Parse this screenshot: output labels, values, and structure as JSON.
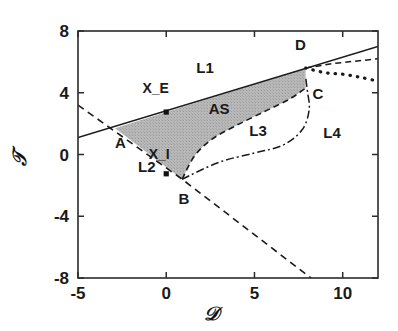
{
  "chart_data": {
    "type": "line",
    "title": "",
    "xlabel": "D",
    "ylabel": "T",
    "xlim": [
      -5,
      12
    ],
    "ylim": [
      -8,
      8
    ],
    "xticks": [
      -5,
      0,
      5,
      10
    ],
    "xticklabels": [
      "-5",
      "0",
      "5",
      "10"
    ],
    "yticks": [
      -8,
      -4,
      0,
      4,
      8
    ],
    "yticklabels": [
      "-8",
      "-4",
      "0",
      "4",
      "8"
    ],
    "grid": false,
    "legend": "none",
    "series": [
      {
        "name": "L1",
        "style": "solid",
        "points": [
          [
            -5,
            1.1
          ],
          [
            12,
            7.0
          ]
        ]
      },
      {
        "name": "L2",
        "style": "dashed",
        "points": [
          [
            -5,
            3.2
          ],
          [
            0.9,
            -1.6
          ],
          [
            8.2,
            -8.0
          ]
        ]
      },
      {
        "name": "L3",
        "style": "dashed-curve",
        "points": [
          [
            0.9,
            -1.6
          ],
          [
            1.6,
            -0.1
          ],
          [
            2.6,
            1.0
          ],
          [
            4.0,
            1.9
          ],
          [
            5.6,
            2.8
          ],
          [
            7.0,
            3.6
          ],
          [
            7.9,
            4.3
          ]
        ]
      },
      {
        "name": "L4",
        "style": "dash-dot",
        "points": [
          [
            0.9,
            -1.6
          ],
          [
            3.0,
            -0.5
          ],
          [
            5.0,
            0.1
          ],
          [
            6.6,
            0.6
          ],
          [
            7.7,
            1.6
          ],
          [
            8.1,
            2.9
          ],
          [
            8.0,
            4.1
          ],
          [
            7.9,
            5.0
          ]
        ]
      },
      {
        "name": "L5-dotted",
        "style": "dotted-thick",
        "points": [
          [
            7.9,
            5.6
          ],
          [
            9.0,
            5.3
          ],
          [
            10.0,
            5.2
          ],
          [
            11.0,
            5.0
          ],
          [
            12.0,
            4.75
          ]
        ]
      },
      {
        "name": "L6-dashed-upper",
        "style": "dashed",
        "points": [
          [
            7.9,
            5.6
          ],
          [
            9.5,
            5.9
          ],
          [
            12.0,
            6.2
          ]
        ]
      }
    ],
    "shaded_region": {
      "name": "AS",
      "fill": "#b3b3b3",
      "vertices": [
        [
          -2.9,
          1.7
        ],
        [
          7.9,
          5.6
        ],
        [
          7.9,
          4.3
        ],
        [
          7.0,
          3.6
        ],
        [
          5.6,
          2.8
        ],
        [
          4.0,
          1.9
        ],
        [
          2.6,
          1.0
        ],
        [
          1.6,
          -0.1
        ],
        [
          0.9,
          -1.6
        ]
      ]
    },
    "markers": [
      {
        "label": "X_E",
        "x": 0.0,
        "y": 2.75
      },
      {
        "label": "X_I",
        "x": 0.0,
        "y": -1.25
      }
    ],
    "annotations": [
      {
        "text": "L1",
        "x": 2.2,
        "y": 5.25
      },
      {
        "text": "X_E",
        "x": -0.6,
        "y": 4.0
      },
      {
        "text": "AS",
        "x": 3.0,
        "y": 2.6
      },
      {
        "text": "A",
        "x": -2.6,
        "y": 0.45
      },
      {
        "text": "L2",
        "x": -1.1,
        "y": -1.15
      },
      {
        "text": "X_I",
        "x": -0.4,
        "y": -0.3
      },
      {
        "text": "B",
        "x": 1.0,
        "y": -3.2
      },
      {
        "text": "L3",
        "x": 5.2,
        "y": 1.2
      },
      {
        "text": "L4",
        "x": 9.4,
        "y": 1.1
      },
      {
        "text": "C",
        "x": 8.6,
        "y": 3.6
      },
      {
        "text": "D",
        "x": 7.6,
        "y": 6.75
      }
    ],
    "colors": {
      "line": "#1a1a1a",
      "shade": "#b3b3b3",
      "axis": "#333333",
      "background": "#ffffff"
    }
  },
  "figure": {
    "axis_x_title": "𝒟",
    "axis_y_title": "𝒯"
  }
}
